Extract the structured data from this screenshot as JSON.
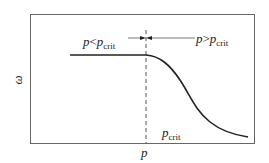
{
  "diagram": {
    "y_axis_label": "ω",
    "x_axis_label": "p",
    "left_region": {
      "symbol": "p",
      "relation": "<",
      "ref": "p",
      "ref_sub": "crit"
    },
    "right_region": {
      "symbol": "p",
      "relation": ">",
      "ref": "p",
      "ref_sub": "crit"
    },
    "crit_label": {
      "symbol": "p",
      "sub": "crit"
    },
    "colors": {
      "line": "#222222",
      "frame": "#555555",
      "dashed": "#555555"
    }
  }
}
